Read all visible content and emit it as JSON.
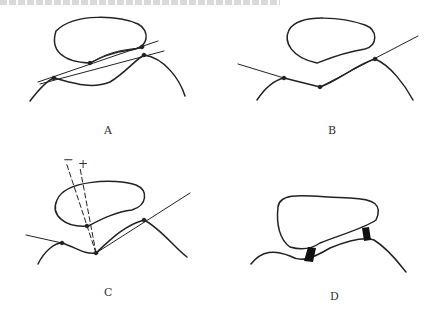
{
  "figure": {
    "panels": [
      {
        "id": "A",
        "label": "A"
      },
      {
        "id": "B",
        "label": "B"
      },
      {
        "id": "C",
        "label": "C"
      },
      {
        "id": "D",
        "label": "D"
      }
    ],
    "annotations": {
      "minus_sign": "−",
      "plus_sign": "+"
    },
    "colors": {
      "stroke": "#222222",
      "background": "#ffffff"
    }
  }
}
